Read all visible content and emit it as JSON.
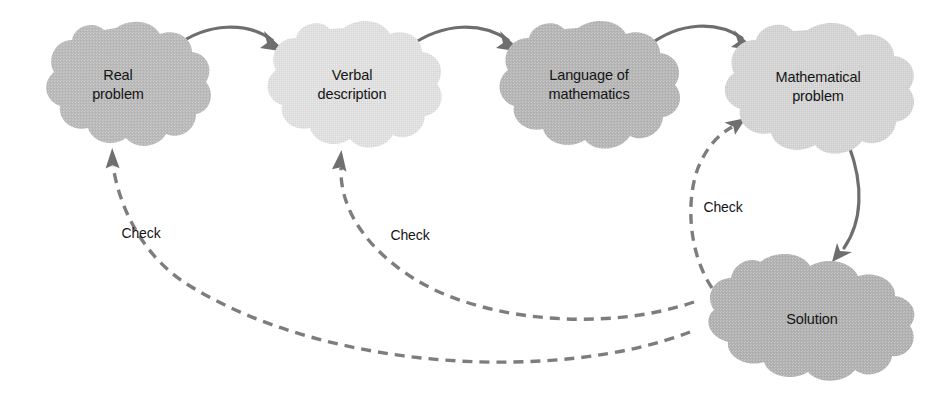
{
  "diagram": {
    "background_color": "#ffffff",
    "nodes": [
      {
        "id": "real-problem",
        "lines": [
          "Real",
          "problem"
        ],
        "shape": "cloud",
        "fill": "#b9b9b9",
        "cx": 116,
        "cy": 86,
        "rx": 66,
        "ry": 58
      },
      {
        "id": "verbal-description",
        "lines": [
          "Verbal",
          "description"
        ],
        "shape": "cloud",
        "fill": "#e1e1e1",
        "cx": 344,
        "cy": 86,
        "rx": 70,
        "ry": 58
      },
      {
        "id": "language-of-mathematics",
        "lines": [
          "Language of",
          "mathematics"
        ],
        "shape": "cloud",
        "fill": "#b5b5b5",
        "cx": 578,
        "cy": 86,
        "rx": 74,
        "ry": 58
      },
      {
        "id": "mathematical-problem",
        "lines": [
          "Mathematical",
          "problem"
        ],
        "shape": "cloud",
        "fill": "#d5d5d5",
        "cx": 808,
        "cy": 88,
        "rx": 76,
        "ry": 58
      },
      {
        "id": "solution",
        "lines": [
          "Solution"
        ],
        "shape": "cloud",
        "fill": "#b1b1b1",
        "cx": 797,
        "cy": 318,
        "rx": 105,
        "ry": 58
      }
    ],
    "solid_edges": [
      {
        "id": "real-to-verbal",
        "from": "real-problem",
        "to": "verbal-description",
        "style": "solid",
        "color": "#6e6e6e"
      },
      {
        "id": "verbal-to-language",
        "from": "verbal-description",
        "to": "language-of-mathematics",
        "style": "solid",
        "color": "#6e6e6e"
      },
      {
        "id": "language-to-mathematical",
        "from": "language-of-mathematics",
        "to": "mathematical-problem",
        "style": "solid",
        "color": "#6e6e6e"
      },
      {
        "id": "mathematical-to-solution",
        "from": "mathematical-problem",
        "to": "solution",
        "style": "solid",
        "color": "#6e6e6e"
      }
    ],
    "dashed_edges": [
      {
        "id": "solution-to-mathematical-check",
        "from": "solution",
        "to": "mathematical-problem",
        "style": "dashed",
        "color": "#7d7d7d",
        "label": "Check",
        "label_x": 723,
        "label_y": 212
      },
      {
        "id": "solution-to-verbal-check",
        "from": "solution",
        "to": "verbal-description",
        "style": "dashed",
        "color": "#7d7d7d",
        "label": "Check",
        "label_x": 410,
        "label_y": 240
      },
      {
        "id": "solution-to-real-check",
        "from": "solution",
        "to": "real-problem",
        "style": "dashed",
        "color": "#7d7d7d",
        "label": "Check",
        "label_x": 141,
        "label_y": 238
      }
    ]
  }
}
